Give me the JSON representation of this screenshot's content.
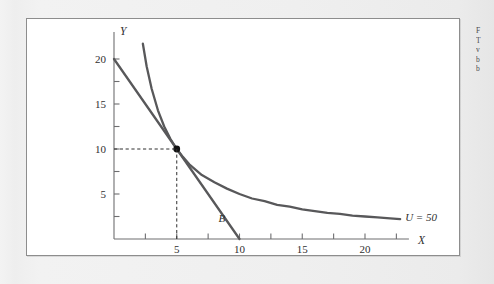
{
  "page": {
    "background_color": "#efefef",
    "panel_background": "#ffffff",
    "panel_border_color": "#8d8d8d"
  },
  "margin_note": {
    "lines": [
      "F",
      "T",
      "v",
      "b",
      "b"
    ]
  },
  "chart_data": {
    "type": "line",
    "title": "",
    "subtitle": "",
    "xlabel": "X",
    "ylabel": "Y",
    "xlim": [
      0,
      23.5
    ],
    "ylim": [
      0,
      23
    ],
    "grid": false,
    "legend": "inline-annotation",
    "axis_color": "#6e6e70",
    "curve_color": "#58585a",
    "xticks": [
      0,
      2.5,
      5,
      7.5,
      10,
      12.5,
      15,
      17.5,
      20,
      22.5
    ],
    "xtick_labels": [
      "",
      "",
      "5",
      "",
      "10",
      "",
      "15",
      "",
      "20",
      ""
    ],
    "yticks": [
      0,
      2.5,
      5,
      7.5,
      10,
      12.5,
      15,
      17.5,
      20
    ],
    "ytick_labels": [
      "",
      "",
      "5",
      "",
      "10",
      "",
      "15",
      "",
      "20"
    ],
    "series": [
      {
        "name": "B",
        "label": "B",
        "type": "budget-line",
        "description": "Budget constraint line",
        "x": [
          0,
          10
        ],
        "values": [
          20,
          0
        ],
        "intercept_y": 20,
        "intercept_x": 10,
        "slope": -2,
        "color": "#58585a"
      },
      {
        "name": "U = 50",
        "label": "U = 50",
        "type": "indifference-curve",
        "description": "Indifference curve X*Y = 50",
        "equation_constant": 50,
        "x": [
          2.3,
          2.6,
          3,
          3.5,
          4,
          4.5,
          5,
          5.5,
          6,
          7,
          8,
          9,
          10,
          11,
          12,
          13,
          14,
          15,
          16,
          17,
          18,
          19,
          20,
          21,
          22,
          22.8
        ],
        "values": [
          21.7,
          19.2,
          16.7,
          14.3,
          12.5,
          11.1,
          10,
          9.1,
          8.3,
          7.1,
          6.3,
          5.6,
          5,
          4.5,
          4.2,
          3.8,
          3.6,
          3.3,
          3.1,
          2.9,
          2.8,
          2.6,
          2.5,
          2.4,
          2.3,
          2.2
        ],
        "color": "#58585a"
      }
    ],
    "annotations": [
      {
        "name": "tangency-point",
        "label": "",
        "x": 5,
        "y": 10,
        "marker": "filled-circle",
        "color": "#111111"
      },
      {
        "name": "guide-line-horizontal",
        "style": "dashed",
        "from": [
          0,
          10
        ],
        "to": [
          5,
          10
        ]
      },
      {
        "name": "guide-line-vertical",
        "style": "dashed",
        "from": [
          5,
          0
        ],
        "to": [
          5,
          10
        ]
      },
      {
        "name": "budget-line-label",
        "label": "B",
        "x": 8.6,
        "y": 1.9
      },
      {
        "name": "indifference-curve-label",
        "label": "U = 50",
        "x": 23.2,
        "y": 2.5
      }
    ]
  }
}
